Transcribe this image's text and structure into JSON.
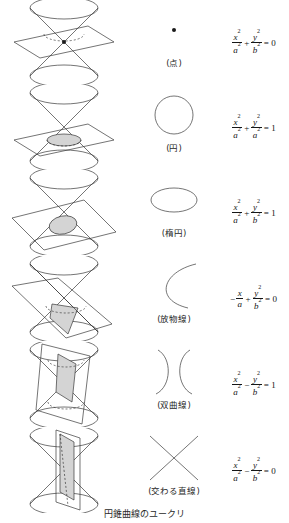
{
  "figure": {
    "caption": "円錐曲線のユークリ",
    "rows": [
      {
        "section_name": "point",
        "cone_description": "double-cone-plane-through-apex",
        "curve_label": "(点)",
        "equation": {
          "terms": [
            {
              "kind": "frac",
              "num": "x",
              "num_sup": "2",
              "den": "a",
              "den_sup": "2"
            },
            {
              "kind": "op",
              "text": "+"
            },
            {
              "kind": "frac",
              "num": "y",
              "num_sup": "2",
              "den": "b",
              "den_sup": "2"
            },
            {
              "kind": "op",
              "text": "="
            },
            {
              "kind": "plain",
              "text": "0"
            }
          ],
          "plain": "x²/a² + y²/b² = 0"
        }
      },
      {
        "section_name": "circle",
        "cone_description": "horizontal-plane-cutting-lower-nappe",
        "curve_label": "(円)",
        "equation": {
          "terms": [
            {
              "kind": "frac",
              "num": "x",
              "num_sup": "2",
              "den": "a",
              "den_sup": "2"
            },
            {
              "kind": "op",
              "text": "+"
            },
            {
              "kind": "frac",
              "num": "y",
              "num_sup": "2",
              "den": "a",
              "den_sup": "2"
            },
            {
              "kind": "op",
              "text": "="
            },
            {
              "kind": "plain",
              "text": "1"
            }
          ],
          "plain": "x²/a² + y²/a² = 1"
        }
      },
      {
        "section_name": "ellipse",
        "cone_description": "tilted-plane-cutting-lower-nappe",
        "curve_label": "(楕円)",
        "equation": {
          "terms": [
            {
              "kind": "frac",
              "num": "x",
              "num_sup": "2",
              "den": "a",
              "den_sup": "2"
            },
            {
              "kind": "op",
              "text": "+"
            },
            {
              "kind": "frac",
              "num": "y",
              "num_sup": "2",
              "den": "b",
              "den_sup": "2"
            },
            {
              "kind": "op",
              "text": "="
            },
            {
              "kind": "plain",
              "text": "1"
            }
          ],
          "plain": "x²/a² + y²/b² = 1"
        }
      },
      {
        "section_name": "parabola",
        "cone_description": "plane-parallel-to-generator",
        "curve_label": "(放物線)",
        "equation": {
          "terms": [
            {
              "kind": "neg",
              "text": "−"
            },
            {
              "kind": "frac",
              "num": "x",
              "num_sup": "",
              "den": "a",
              "den_sup": ""
            },
            {
              "kind": "op",
              "text": "+"
            },
            {
              "kind": "frac",
              "num": "y",
              "num_sup": "2",
              "den": "b",
              "den_sup": "2"
            },
            {
              "kind": "op",
              "text": "="
            },
            {
              "kind": "plain",
              "text": "0"
            }
          ],
          "plain": "− x/a + y²/b² = 0"
        }
      },
      {
        "section_name": "hyperbola",
        "cone_description": "steep-plane-cutting-both-nappes",
        "curve_label": "(双曲線)",
        "equation": {
          "terms": [
            {
              "kind": "frac",
              "num": "x",
              "num_sup": "2",
              "den": "a",
              "den_sup": "2"
            },
            {
              "kind": "op",
              "text": "−"
            },
            {
              "kind": "frac",
              "num": "y",
              "num_sup": "2",
              "den": "b",
              "den_sup": "2"
            },
            {
              "kind": "op",
              "text": "="
            },
            {
              "kind": "plain",
              "text": "1"
            }
          ],
          "plain": "x²/a² − y²/b² = 1"
        }
      },
      {
        "section_name": "intersecting-lines",
        "cone_description": "vertical-plane-through-apex",
        "curve_label": "(交わる直線)",
        "equation": {
          "terms": [
            {
              "kind": "frac",
              "num": "x",
              "num_sup": "2",
              "den": "a",
              "den_sup": "2"
            },
            {
              "kind": "op",
              "text": "−"
            },
            {
              "kind": "frac",
              "num": "y",
              "num_sup": "2",
              "den": "b",
              "den_sup": "2"
            },
            {
              "kind": "op",
              "text": "="
            },
            {
              "kind": "plain",
              "text": "0"
            }
          ],
          "plain": "x²/a² − y²/b² = 0"
        }
      }
    ]
  },
  "style": {
    "stroke": "#3a3a3a",
    "fill_shade": "#d4d4d4",
    "background": "#ffffff"
  }
}
